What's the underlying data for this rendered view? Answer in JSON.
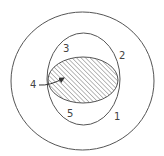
{
  "diagram": {
    "type": "nested-region-diagram",
    "colors": {
      "stroke": "#555555",
      "hatch": "#666666",
      "label": "#444444",
      "background": "#ffffff"
    },
    "shapes": [
      {
        "id": "outer-circle",
        "cx": 82.5,
        "cy": 81,
        "rx": 71.5,
        "ry": 69,
        "label": "1"
      },
      {
        "id": "middle-circle",
        "cx": 83.5,
        "cy": 79,
        "rx": 36.5,
        "ry": 46,
        "label": "2"
      },
      {
        "id": "hatched-ellipse",
        "cx": 83,
        "cy": 80,
        "rx": 35,
        "ry": 23,
        "hatched": true
      }
    ],
    "labels": [
      {
        "id": "label-1",
        "text": "1",
        "x": 114,
        "y": 120
      },
      {
        "id": "label-2",
        "text": "2",
        "x": 119,
        "y": 59
      },
      {
        "id": "label-3",
        "text": "3",
        "x": 63,
        "y": 52
      },
      {
        "id": "label-4",
        "text": "4",
        "x": 30,
        "y": 88
      },
      {
        "id": "label-5",
        "text": "5",
        "x": 67,
        "y": 117
      }
    ],
    "arrow": {
      "from_label": "4",
      "points_to": "hatched-ellipse",
      "start": [
        39,
        85
      ],
      "end": [
        64,
        78
      ]
    }
  }
}
